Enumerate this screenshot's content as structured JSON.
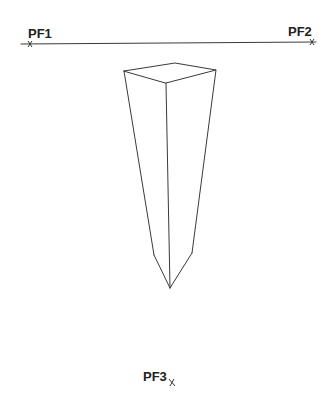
{
  "diagram": {
    "horizon_line": {
      "x1": 21,
      "y1": 44,
      "x2": 316,
      "y2": 42
    },
    "vanishing_points": [
      {
        "label": "PF1",
        "x": 30,
        "y": 44,
        "label_x": 28,
        "label_y": 38
      },
      {
        "label": "PF2",
        "x": 312,
        "y": 42,
        "label_x": 288,
        "label_y": 36
      },
      {
        "label": "PF3",
        "x": 172,
        "y": 382,
        "label_x": 143,
        "label_y": 381
      }
    ],
    "prism": {
      "top_face": [
        [
          124,
          71
        ],
        [
          175,
          63
        ],
        [
          216,
          70
        ],
        [
          166,
          83
        ]
      ],
      "edges": [
        [
          [
            124,
            71
          ],
          [
            154,
            255
          ]
        ],
        [
          [
            166,
            83
          ],
          [
            170,
            288
          ]
        ],
        [
          [
            216,
            70
          ],
          [
            192,
            253
          ]
        ],
        [
          [
            154,
            255
          ],
          [
            170,
            288
          ]
        ],
        [
          [
            192,
            253
          ],
          [
            170,
            288
          ]
        ]
      ]
    }
  },
  "labels": {
    "pf1": "PF1",
    "pf2": "PF2",
    "pf3": "PF3"
  }
}
